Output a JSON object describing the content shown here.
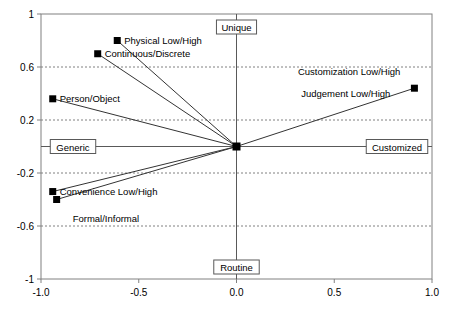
{
  "chart_data": {
    "type": "scatter",
    "title": "",
    "xlabel": "",
    "ylabel": "",
    "xlim": [
      -1.0,
      1.0
    ],
    "ylim": [
      -1.0,
      1.0
    ],
    "grid": true,
    "legend": null,
    "x_ticks": [
      "-1.0",
      "-0.5",
      "0.0",
      "0.5",
      "1.0"
    ],
    "x_tick_values": [
      -1.0,
      -0.5,
      0.0,
      0.5,
      1.0
    ],
    "y_ticks": [
      "1",
      "0.6",
      "0.2",
      "-0.2",
      "-0.6",
      "-1"
    ],
    "y_tick_values": [
      1,
      0.6,
      0.2,
      -0.2,
      -0.6,
      -1
    ],
    "axis_labels": {
      "top": "Unique",
      "bottom": "Routine",
      "left": "Generic",
      "right": "Customized"
    },
    "origin": {
      "x": 0.0,
      "y": 0.0
    },
    "points": [
      {
        "label": "Physical Low/High",
        "x": -0.61,
        "y": 0.8,
        "label_dx": 7,
        "label_dy": 3
      },
      {
        "label": "Continuous/Discrete",
        "x": -0.71,
        "y": 0.7,
        "label_dx": 7,
        "label_dy": 3
      },
      {
        "label": "Person/Object",
        "x": -0.94,
        "y": 0.36,
        "label_dx": 7,
        "label_dy": 3
      },
      {
        "label": "Convenience Low/High",
        "x": -0.94,
        "y": -0.34,
        "label_dx": 7,
        "label_dy": 3
      },
      {
        "label": "Formal/Informal",
        "x": -0.92,
        "y": -0.4,
        "label_dx": 16,
        "label_dy": 22
      },
      {
        "label": "Customization Low/High",
        "x": 0.91,
        "y": 0.44,
        "label_dx": -14,
        "label_dy": -13,
        "label_anchor": "end"
      },
      {
        "label": "Judgement Low/High",
        "x": 0.91,
        "y": 0.44,
        "label_dx": -24,
        "label_dy": 9,
        "label_anchor": "end"
      }
    ],
    "connectors": [
      {
        "from": {
          "x": 0.0,
          "y": 0.0
        },
        "to": {
          "x": -0.61,
          "y": 0.8
        }
      },
      {
        "from": {
          "x": 0.0,
          "y": 0.0
        },
        "to": {
          "x": -0.71,
          "y": 0.7
        }
      },
      {
        "from": {
          "x": 0.0,
          "y": 0.0
        },
        "to": {
          "x": -0.94,
          "y": 0.36
        }
      },
      {
        "from": {
          "x": 0.0,
          "y": 0.0
        },
        "to": {
          "x": -0.94,
          "y": -0.34
        }
      },
      {
        "from": {
          "x": 0.0,
          "y": 0.0
        },
        "to": {
          "x": -0.92,
          "y": -0.4
        }
      },
      {
        "from": {
          "x": 0.0,
          "y": 0.0
        },
        "to": {
          "x": 0.91,
          "y": 0.44
        }
      }
    ],
    "colors": {
      "marker": "#000000",
      "line": "#333333",
      "grid": "#808080",
      "frame": "#808080",
      "axis": "#595959",
      "background": "#ffffff"
    }
  }
}
